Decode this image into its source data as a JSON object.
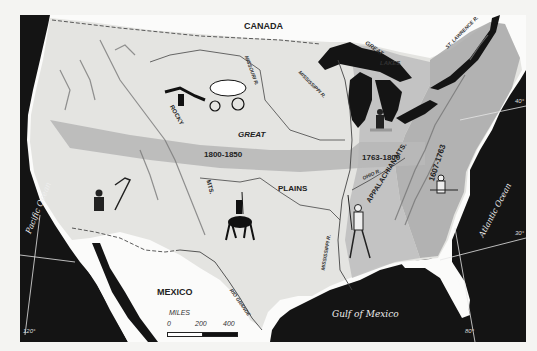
{
  "map": {
    "title_regions": {
      "canada": "CANADA",
      "mexico": "MEXICO",
      "great": "GREAT",
      "plains": "PLAINS",
      "rocky": "ROCKY",
      "mts": "MTS.",
      "appalachian_mts": "APPALACHIAN MTS."
    },
    "water_labels": {
      "pacific": "Pacific Ocean",
      "atlantic": "Atlantic Ocean",
      "gulf": "Gulf of Mexico",
      "great_lakes_1": "GREAT",
      "great_lakes_2": "LAKES"
    },
    "rivers": {
      "missouri": "MISSOURI R.",
      "mississippi_north": "MISSISSIPPI R.",
      "mississippi_south": "MISSISSIPPI R.",
      "ohio": "OHIO R.",
      "st_lawrence": "ST. LAWRENCE R.",
      "rio_grande": "RIO GRANDE"
    },
    "settlement_bands": [
      {
        "period": "1607-1763",
        "color": "#a9a9a9"
      },
      {
        "period": "1763-1800",
        "color": "#b4b4b4"
      },
      {
        "period": "1800-1850",
        "color": "#b8b8b8"
      }
    ],
    "scale": {
      "unit": "MILES",
      "ticks": [
        "0",
        "200",
        "400"
      ]
    },
    "graticule": {
      "lat_40": "40°",
      "lat_30": "30°",
      "lon_120": "120°",
      "lon_80": "80°"
    },
    "illustrations": [
      "covered-wagon-with-horses",
      "frontiersman-with-rifle-great-lakes",
      "colonist-with-musket-east",
      "spanish-conquistador-on-horse",
      "mission-padre-southwest",
      "frontiersman-with-rifle-mississippi"
    ],
    "colors": {
      "water": "#121212",
      "land": "#e6e6e3",
      "outside": "#fbfbfa",
      "band": "#b3b3b3"
    }
  }
}
